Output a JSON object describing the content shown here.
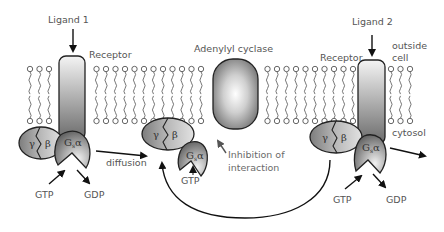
{
  "labels": {
    "ligand1": "Ligand 1",
    "ligand2": "Ligand 2",
    "receptor_left": "Receptor",
    "receptor_right": "Receptor",
    "adenylyl_cyclase": "Adenylyl cyclase",
    "outside_cell_line1": "outside",
    "outside_cell_line2": "cell",
    "cytosol": "cytosol",
    "diffusion": "diffusion",
    "inhibition_line1": "Inhibition of",
    "inhibition_line2": "interaction",
    "gtp_left": "GTP",
    "gdp_left": "GDP",
    "gtp_middle": "GTP",
    "gtp_right": "GTP",
    "gdp_right": "GDP"
  },
  "subunits": {
    "gamma": "γ",
    "beta": "β",
    "galpha_main": "G",
    "galpha_sub": "s",
    "galpha_greek": "α"
  },
  "colors": {
    "background": "#ffffff",
    "membrane_line": "#666666",
    "receptor_top": "#f2f2f2",
    "receptor_bottom": "#6e6e6e",
    "cyclase_center": "#ffffff",
    "cyclase_edge": "#7a7a7a",
    "subunit_dark": "#8a8a8a",
    "subunit_light": "#d6d6d6",
    "label_text": "#555555",
    "arrow": "#111111"
  },
  "nodes": [
    {
      "id": "receptor-1",
      "type": "receptor",
      "label": "Receptor"
    },
    {
      "id": "adenylyl-cyclase",
      "type": "enzyme",
      "label": "Adenylyl cyclase"
    },
    {
      "id": "receptor-2",
      "type": "receptor",
      "label": "Receptor"
    },
    {
      "id": "g-beta-gamma-left",
      "type": "g-protein-dimer",
      "label": "γ β"
    },
    {
      "id": "g-alpha-left",
      "type": "g-protein-alpha",
      "label": "Gsα"
    },
    {
      "id": "g-beta-gamma-middle",
      "type": "g-protein-dimer",
      "label": "γ β"
    },
    {
      "id": "g-alpha-middle",
      "type": "g-protein-alpha",
      "label": "Gsα"
    },
    {
      "id": "g-beta-gamma-right",
      "type": "g-protein-dimer",
      "label": "γ β"
    },
    {
      "id": "g-alpha-right",
      "type": "g-protein-alpha",
      "label": "Gsα"
    }
  ],
  "edges": [
    {
      "from": "Ligand 1",
      "to": "receptor-1",
      "label": ""
    },
    {
      "from": "Ligand 2",
      "to": "receptor-2",
      "label": ""
    },
    {
      "from": "g-beta-gamma-left",
      "to": "g-beta-gamma-middle",
      "label": "diffusion"
    },
    {
      "from": "g-beta-gamma-right",
      "to": "g-beta-gamma-middle",
      "label": ""
    },
    {
      "from": "g-alpha-middle",
      "to": "adenylyl-cyclase",
      "label": "Inhibition of interaction"
    },
    {
      "from": "GTP",
      "to": "g-alpha-left",
      "label": ""
    },
    {
      "from": "g-alpha-left",
      "to": "GDP",
      "label": ""
    },
    {
      "from": "GTP",
      "to": "g-alpha-right",
      "label": ""
    },
    {
      "from": "g-alpha-right",
      "to": "GDP",
      "label": ""
    },
    {
      "from": "g-alpha-right",
      "to": "cytosol",
      "label": ""
    }
  ]
}
